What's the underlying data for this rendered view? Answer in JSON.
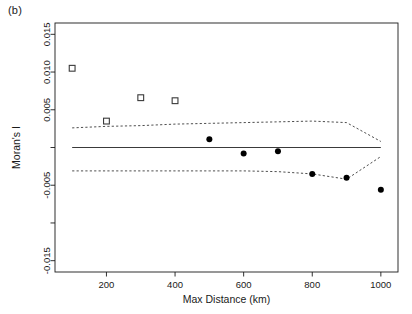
{
  "figure": {
    "panel_label": "(b)",
    "background": "#ffffff",
    "foreground": "#1a1a1a"
  },
  "chart_data": {
    "type": "scatter",
    "title": "(b)",
    "xlabel": "Max Distance (km)",
    "ylabel": "Moran's I",
    "xlim": [
      50,
      1050
    ],
    "ylim": [
      -0.0165,
      0.0165
    ],
    "grid": false,
    "legend": null,
    "xticks": [
      200,
      400,
      600,
      800,
      1000
    ],
    "xtick_labels": [
      "200",
      "400",
      "600",
      "800",
      "1000"
    ],
    "yticks": [
      0.015,
      0.01,
      0.005,
      0.0,
      -0.005,
      -0.01,
      -0.015
    ],
    "ytick_labels": [
      "0.015",
      "0.010",
      "0.005",
      "",
      "-0.005",
      "",
      "-0.015"
    ],
    "series": [
      {
        "name": "Significant (open square)",
        "marker": "open-square",
        "color": "#3a3a3a",
        "x": [
          100,
          200,
          300,
          400
        ],
        "values": [
          0.0105,
          0.0035,
          0.0066,
          0.0062
        ]
      },
      {
        "name": "Non-significant (filled circle)",
        "marker": "filled-circle",
        "color": "#000000",
        "x": [
          500,
          600,
          700,
          800,
          900,
          1000
        ],
        "values": [
          0.0011,
          -0.0008,
          -0.0005,
          -0.0035,
          -0.004,
          -0.0056
        ]
      }
    ],
    "reference_line": {
      "name": "zero-line",
      "style": "solid",
      "color": "#3a3a3a",
      "x": [
        100,
        1000
      ],
      "values": [
        0.0,
        0.0
      ]
    },
    "envelopes": [
      {
        "name": "upper-confidence-envelope",
        "style": "dashed",
        "color": "#3a3a3a",
        "x": [
          100,
          200,
          300,
          400,
          500,
          600,
          700,
          800,
          900,
          1000
        ],
        "values": [
          0.0026,
          0.0028,
          0.0029,
          0.0031,
          0.0032,
          0.0033,
          0.0034,
          0.0035,
          0.0033,
          0.0008
        ]
      },
      {
        "name": "lower-confidence-envelope",
        "style": "dashed",
        "color": "#3a3a3a",
        "x": [
          100,
          200,
          300,
          400,
          500,
          600,
          700,
          800,
          900,
          1000
        ],
        "values": [
          -0.0031,
          -0.0031,
          -0.0031,
          -0.0031,
          -0.0031,
          -0.0031,
          -0.0032,
          -0.0035,
          -0.0042,
          -0.0012
        ]
      }
    ]
  }
}
